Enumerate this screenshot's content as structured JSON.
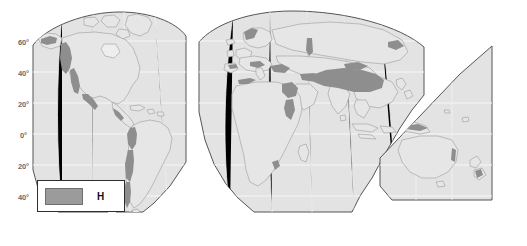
{
  "map": {
    "title": "World map of highland (H) climate regions",
    "projection": "interrupted-pseudocylindrical",
    "colors": {
      "land_fill": "#e3e3e3",
      "land_outline": "#9a9a9a",
      "frame_outline": "#555555",
      "highland_fill": "#8e8e8e",
      "graticule": "#f4f4f4",
      "background": "#ffffff",
      "label_text": "#6b6b6b"
    },
    "latitude_labels": [
      {
        "id": "lat-60n",
        "text": "60°",
        "x": 18,
        "y": 38
      },
      {
        "id": "lat-40n",
        "text": "40°",
        "x": 18,
        "y": 69
      },
      {
        "id": "lat-20n",
        "text": "20°",
        "x": 18,
        "y": 100
      },
      {
        "id": "lat-0",
        "text": "0°",
        "x": 20,
        "y": 131
      },
      {
        "id": "lat-20s",
        "text": "20°",
        "x": 18,
        "y": 162
      },
      {
        "id": "lat-40s",
        "text": "40°",
        "x": 18,
        "y": 193
      }
    ],
    "legend": {
      "swatch_label": "highland-climate-swatch",
      "label": "H",
      "swatch_color": "#9b9b9b"
    }
  }
}
